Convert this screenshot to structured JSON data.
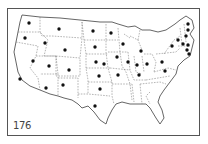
{
  "figure": {
    "number": "176"
  },
  "map": {
    "outline_color": "#555555",
    "border_color": "#777777",
    "dot_color": "#111111",
    "dots": [
      {
        "x": 29,
        "y": 23
      },
      {
        "x": 25,
        "y": 38
      },
      {
        "x": 45,
        "y": 43
      },
      {
        "x": 59,
        "y": 29
      },
      {
        "x": 65,
        "y": 50
      },
      {
        "x": 33,
        "y": 61
      },
      {
        "x": 20,
        "y": 79
      },
      {
        "x": 49,
        "y": 66
      },
      {
        "x": 69,
        "y": 70
      },
      {
        "x": 46,
        "y": 88
      },
      {
        "x": 63,
        "y": 85
      },
      {
        "x": 93,
        "y": 31
      },
      {
        "x": 95,
        "y": 47
      },
      {
        "x": 96,
        "y": 62
      },
      {
        "x": 99,
        "y": 76
      },
      {
        "x": 100,
        "y": 89
      },
      {
        "x": 95,
        "y": 106
      },
      {
        "x": 111,
        "y": 33
      },
      {
        "x": 117,
        "y": 57
      },
      {
        "x": 118,
        "y": 75
      },
      {
        "x": 123,
        "y": 44
      },
      {
        "x": 128,
        "y": 62
      },
      {
        "x": 141,
        "y": 51
      },
      {
        "x": 137,
        "y": 65
      },
      {
        "x": 147,
        "y": 64
      },
      {
        "x": 139,
        "y": 75
      },
      {
        "x": 104,
        "y": 64
      },
      {
        "x": 172,
        "y": 46
      },
      {
        "x": 162,
        "y": 62
      },
      {
        "x": 165,
        "y": 71
      },
      {
        "x": 178,
        "y": 40
      },
      {
        "x": 183,
        "y": 44
      },
      {
        "x": 186,
        "y": 36
      },
      {
        "x": 188,
        "y": 30
      },
      {
        "x": 187,
        "y": 50
      },
      {
        "x": 189,
        "y": 54
      },
      {
        "x": 188,
        "y": 45
      },
      {
        "x": 188,
        "y": 24
      }
    ]
  }
}
